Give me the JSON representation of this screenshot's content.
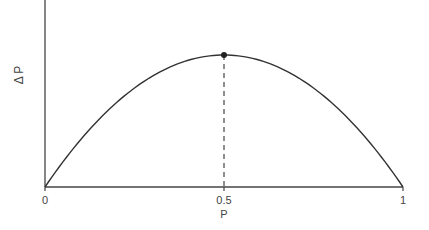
{
  "chart_data": {
    "type": "line",
    "title": "",
    "xlabel": "P",
    "ylabel": "Δ P",
    "x_ticks": [
      "0",
      "0.5",
      "1"
    ],
    "xlim": [
      0,
      1
    ],
    "grid": false,
    "series": [
      {
        "name": "ΔP vs P",
        "x": [
          0,
          0.1,
          0.2,
          0.3,
          0.4,
          0.5,
          0.6,
          0.7,
          0.8,
          0.9,
          1.0
        ],
        "y": [
          0,
          0.36,
          0.64,
          0.84,
          0.96,
          1.0,
          0.96,
          0.84,
          0.64,
          0.36,
          0
        ]
      }
    ],
    "annotations": [
      {
        "type": "point",
        "x": 0.5,
        "y": 1.0,
        "label": "maximum"
      },
      {
        "type": "dashed-vertical-line",
        "x": 0.5
      }
    ]
  },
  "labels": {
    "x0": "0",
    "xmid": "0.5",
    "x1": "1",
    "xaxis": "P",
    "yaxis": "Δ P"
  }
}
